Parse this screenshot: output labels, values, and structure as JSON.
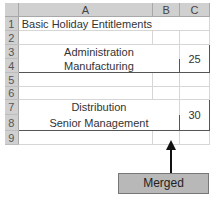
{
  "spreadsheet": {
    "columns": [
      "A",
      "B",
      "C"
    ],
    "rows": [
      "1",
      "2",
      "3",
      "4",
      "5",
      "6",
      "7",
      "8",
      "9"
    ],
    "title_cell": "Basic Holiday Entitlements",
    "group1": {
      "line1": "Administration",
      "line2": "Manufacturing",
      "value": "25"
    },
    "group2": {
      "line1": "Distribution",
      "line2": "Senior Management",
      "value": "30"
    }
  },
  "annotation": {
    "label": "Merged",
    "fill_color": "#b8b8b8"
  }
}
